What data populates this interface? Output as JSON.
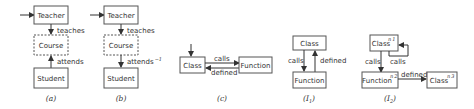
{
  "figure": {
    "panels": [
      {
        "caption": "(a)",
        "nodes": [
          "Teacher",
          "Course",
          "Student"
        ],
        "edges": [
          {
            "from": "Teacher",
            "to": "Course",
            "label": "teaches"
          },
          {
            "from": "Student",
            "to": "Course",
            "label": "attends"
          }
        ]
      },
      {
        "caption": "(b)",
        "nodes": [
          "Teacher",
          "Course",
          "Student"
        ],
        "edges": [
          {
            "from": "Teacher",
            "to": "Course",
            "label": "teaches"
          },
          {
            "from": "Course",
            "to": "Student",
            "label": "attends",
            "label_sup": "−1"
          }
        ]
      },
      {
        "caption": "(c)",
        "nodes": [
          "Class",
          "Function"
        ],
        "edges": [
          {
            "from": "Class",
            "to": "Function",
            "label": "calls"
          },
          {
            "from": "Function",
            "to": "Class",
            "label": "defined"
          }
        ]
      },
      {
        "caption": "(I",
        "caption_sub": "1",
        "caption_end": ")",
        "nodes": [
          "Class",
          "Function"
        ],
        "edges": [
          {
            "from": "Class",
            "to": "Function",
            "label": "calls"
          },
          {
            "from": "Function",
            "to": "Class",
            "label": "defined"
          }
        ]
      },
      {
        "caption": "(I",
        "caption_sub": "2",
        "caption_end": ")",
        "nodes": [
          {
            "label": "Class",
            "id": "n",
            "id_sub": "1"
          },
          {
            "label": "Function",
            "id": "n",
            "id_sub": "2"
          },
          {
            "label": "Class",
            "id": "n",
            "id_sub": "3"
          }
        ],
        "edges": [
          {
            "from": "n1",
            "to": "n2",
            "label": "calls"
          },
          {
            "from": "n1",
            "to": "n1",
            "label": "calls"
          },
          {
            "from": "n2",
            "to": "n3",
            "label": "defined"
          }
        ]
      }
    ]
  }
}
